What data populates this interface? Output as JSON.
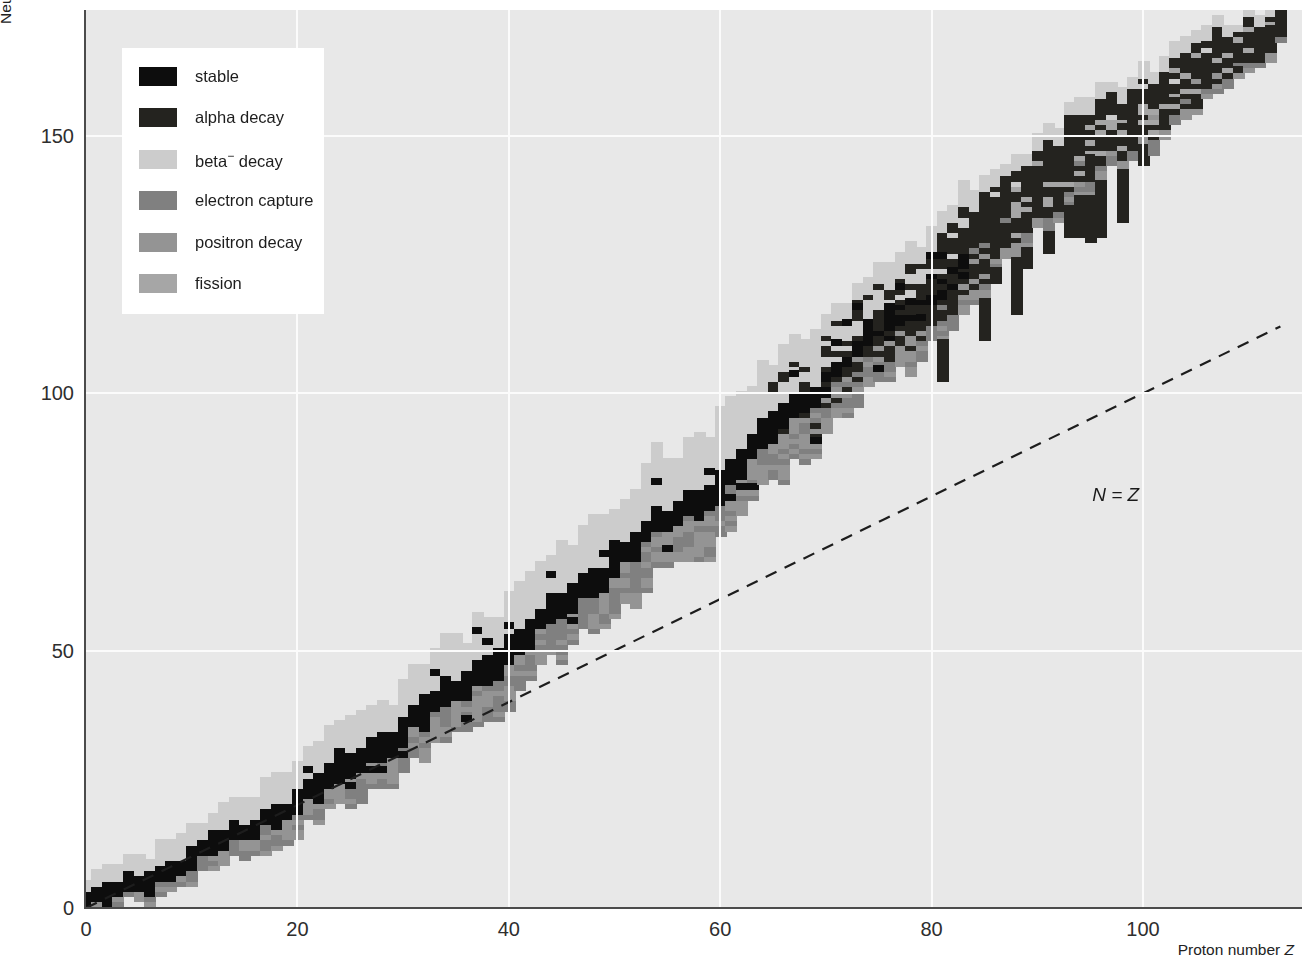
{
  "chart_data": {
    "type": "heatmap",
    "xlabel": "Proton number Z",
    "ylabel": "Neutron number N",
    "xlim": [
      0,
      115
    ],
    "ylim": [
      0,
      175
    ],
    "xticks": [
      0,
      20,
      40,
      60,
      80,
      100
    ],
    "yticks": [
      0,
      50,
      100,
      150
    ],
    "grid": true,
    "legend_position": "upper left",
    "annotations": [
      {
        "text": "N = Z",
        "x": 95,
        "y": 80
      }
    ],
    "reference_line": {
      "label": "N = Z",
      "style": "dashed",
      "from": {
        "x": 0,
        "y": 0
      },
      "to": {
        "x": 113,
        "y": 113
      }
    },
    "categories": [
      "stable",
      "alpha decay",
      "beta⁻ decay",
      "electron capture",
      "positron decay",
      "fission"
    ],
    "category_colors": {
      "stable": "#0d0d0d",
      "alpha_decay": "#24231f",
      "beta_minus_decay": "#cccccc",
      "electron_capture": "#808080",
      "positron_decay": "#949494",
      "fission": "#a6a6a6"
    },
    "plot_background": "#e8e8e8",
    "gridline_color": "#fbfbfb",
    "axis_color": "#4b4b4b",
    "bands": {
      "stability_line_anchors": [
        {
          "Z": 0,
          "N": 1
        },
        {
          "Z": 10,
          "N": 10
        },
        {
          "Z": 20,
          "N": 21
        },
        {
          "Z": 30,
          "N": 35
        },
        {
          "Z": 40,
          "N": 50
        },
        {
          "Z": 50,
          "N": 68
        },
        {
          "Z": 60,
          "N": 83
        },
        {
          "Z": 70,
          "N": 103
        },
        {
          "Z": 80,
          "N": 120
        },
        {
          "Z": 90,
          "N": 140
        },
        {
          "Z": 100,
          "N": 155
        },
        {
          "Z": 113,
          "N": 172
        }
      ],
      "beta_minus_width_anchors": [
        {
          "Z": 0,
          "width": 3
        },
        {
          "Z": 20,
          "width": 7
        },
        {
          "Z": 40,
          "width": 10
        },
        {
          "Z": 60,
          "width": 12
        },
        {
          "Z": 80,
          "width": 12
        },
        {
          "Z": 100,
          "width": 8
        },
        {
          "Z": 113,
          "width": 5
        }
      ],
      "proton_rich_width_anchors": [
        {
          "Z": 0,
          "width": 2
        },
        {
          "Z": 20,
          "width": 6
        },
        {
          "Z": 40,
          "width": 9
        },
        {
          "Z": 60,
          "width": 10
        },
        {
          "Z": 80,
          "width": 10
        },
        {
          "Z": 100,
          "width": 7
        },
        {
          "Z": 113,
          "width": 4
        }
      ],
      "alpha_region_min_Z": 64,
      "fission_region_min_Z": 88
    }
  },
  "axes": {
    "y_label": "Neutron number ",
    "y_label_symbol": "N",
    "x_label": "Proton number ",
    "x_label_symbol": "Z",
    "y_ticks": [
      "0",
      "50",
      "100",
      "150"
    ],
    "x_ticks": [
      "0",
      "20",
      "40",
      "60",
      "80",
      "100"
    ]
  },
  "annotation": {
    "nz_line_label_prefix": "N",
    "nz_line_label_eq": " = ",
    "nz_line_label_suffix": "Z",
    "nz_line_label": "N = Z"
  },
  "legend": {
    "items": [
      {
        "label": "stable",
        "color": "#0d0d0d",
        "name": "stable"
      },
      {
        "label": "alpha decay",
        "color": "#24231f",
        "name": "alpha-decay"
      },
      {
        "label": "beta",
        "label_sup": "−",
        "label_tail": " decay",
        "color": "#cccccc",
        "name": "beta-minus-decay"
      },
      {
        "label": "electron capture",
        "color": "#808080",
        "name": "electron-capture"
      },
      {
        "label": "positron decay",
        "color": "#949494",
        "name": "positron-decay"
      },
      {
        "label": "fission",
        "color": "#a6a6a6",
        "name": "fission"
      }
    ]
  }
}
